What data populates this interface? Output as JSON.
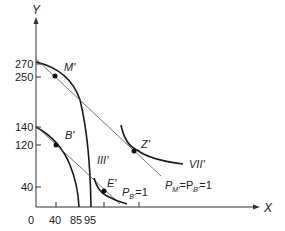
{
  "diagram": {
    "axes": {
      "x_label": "X",
      "y_label": "Y",
      "origin_label": "0",
      "x_ticks": [
        "40",
        "85",
        "95"
      ],
      "y_ticks": [
        "270",
        "250",
        "140",
        "120",
        "40"
      ]
    },
    "points": [
      {
        "label": "M'",
        "x": 40,
        "y": 250
      },
      {
        "label": "B'",
        "x": 40,
        "y": 120
      },
      {
        "label": "E'",
        "x": 120,
        "y": 40
      },
      {
        "label": "Z'",
        "x": 175,
        "y": 120
      }
    ],
    "curve_labels": {
      "indifference_low": "III'",
      "indifference_high": "VII'"
    },
    "price_labels": {
      "low": {
        "main": "P",
        "sub": "B'",
        "rest": "=1"
      },
      "high": {
        "main": "P",
        "sub": "M'",
        "mid": "=P",
        "sub2": "B'",
        "rest": "=1"
      }
    },
    "colors": {
      "curve": "#1a1a1a",
      "line": "#555555",
      "axis": "#333333"
    }
  }
}
